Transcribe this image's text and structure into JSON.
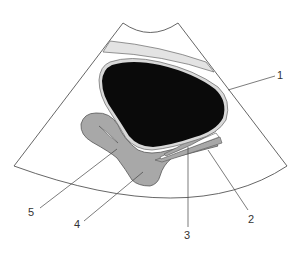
{
  "diagram": {
    "type": "ultrasound-schematic",
    "colors": {
      "background": "#ffffff",
      "outline": "#555555",
      "bladder_fill": "#0a0a0a",
      "bladder_rim": "#d9d9d9",
      "gray_structure": "#a8a8a8",
      "light_band": "#e3e3e3",
      "leader_line": "#444444"
    },
    "labels": [
      {
        "id": "1",
        "text": "1"
      },
      {
        "id": "2",
        "text": "2"
      },
      {
        "id": "3",
        "text": "3"
      },
      {
        "id": "4",
        "text": "4"
      },
      {
        "id": "5",
        "text": "5"
      }
    ]
  }
}
